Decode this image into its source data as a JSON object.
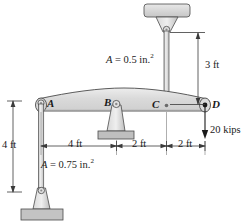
{
  "figure": {
    "type": "engineering-mechanics-diagram"
  },
  "points": {
    "a": "A",
    "b": "B",
    "c": "C",
    "d": "D"
  },
  "annotations": {
    "area_rod_top_var": "A",
    "area_rod_top_eq": " = 0.5 in.",
    "area_rod_top_exp": "2",
    "area_rod_left_var": "A",
    "area_rod_left_eq": " = 0.75 in.",
    "area_rod_left_exp": "2",
    "load": "20 kips"
  },
  "dimensions": {
    "vertical_left": "4 ft",
    "vertical_top": "3 ft",
    "span_ab": "4 ft",
    "span_bc": "2 ft",
    "span_cd": "2 ft"
  },
  "colors": {
    "outline": "#4a4a4a",
    "beam_fill": "#dcdcdc",
    "rod_fill": "#d2d2d2",
    "support_fill": "#c8c8c8",
    "ground_fill": "#c0c0c0",
    "dim_line": "#3a3a3a",
    "text": "#1a1a1a"
  },
  "geometry": {
    "beam_left_x": 38,
    "beam_right_x": 207,
    "beam_axis_y": 105,
    "point_b_x": 115,
    "point_c_x": 163,
    "rod_left_top_y": 103,
    "rod_left_bottom_y": 190,
    "rod_top_ceiling_y": 30,
    "dim_line_y": 146
  }
}
